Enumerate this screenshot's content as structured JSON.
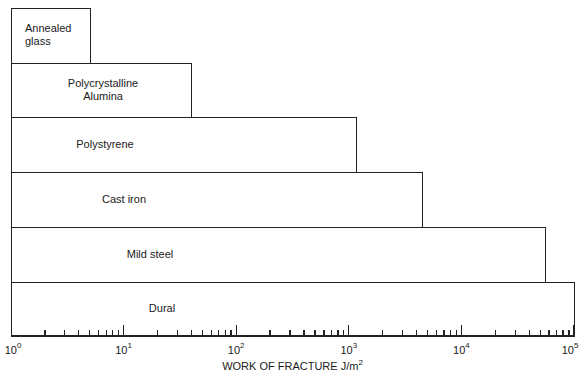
{
  "chart_data": {
    "type": "bar",
    "orientation": "horizontal",
    "title": "",
    "xlabel": "WORK OF FRACTURE J/m2",
    "xlabel_base": "WORK OF FRACTURE J/m",
    "xlabel_sup": "2",
    "ylabel": "",
    "xscale": "log",
    "xlim": [
      1,
      100000
    ],
    "x_tick_labels": [
      {
        "base": "10",
        "exp": "0",
        "value": 1
      },
      {
        "base": "10",
        "exp": "1",
        "value": 10
      },
      {
        "base": "10",
        "exp": "2",
        "value": 100
      },
      {
        "base": "10",
        "exp": "3",
        "value": 1000
      },
      {
        "base": "10",
        "exp": "4",
        "value": 10000
      },
      {
        "base": "10",
        "exp": "5",
        "value": 100000
      }
    ],
    "grid": false,
    "legend": null,
    "categories": [
      "Annealed glass",
      "Polycrystalline Alumina",
      "Polystyrene",
      "Cast iron",
      "Mild steel",
      "Dural"
    ],
    "display_labels": [
      "Annealed\nglass",
      "Polycrystalline\nAlumina",
      "Polystyrene",
      "Cast iron",
      "Mild steel",
      "Dural"
    ],
    "values": [
      5,
      40,
      1150,
      4500,
      55000,
      100000
    ]
  }
}
